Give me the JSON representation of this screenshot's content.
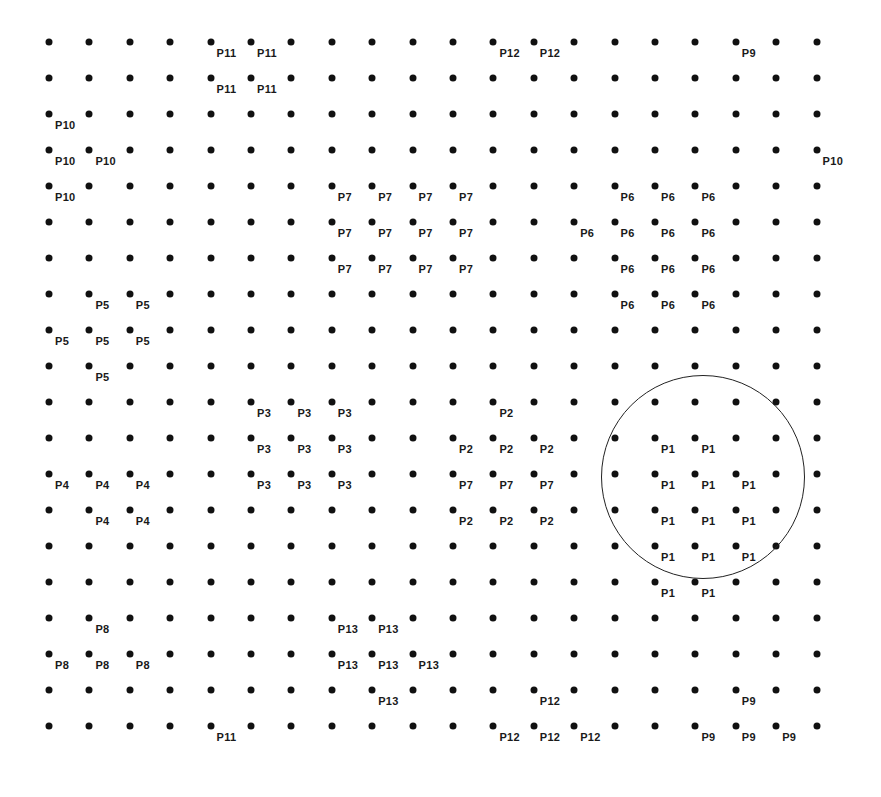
{
  "diagram": {
    "type": "labeled-grid",
    "grid": {
      "rows": 20,
      "cols": 20,
      "origin_x": 49,
      "origin_y": 42,
      "dx": 40.4,
      "dy": 36.0,
      "dot_color": "#111111"
    },
    "highlight_circle": {
      "center_x": 703,
      "center_y": 477,
      "radius": 102,
      "stroke": "#222222",
      "encloses_group": "P1"
    },
    "labels": [
      {
        "text": "P11",
        "row": 0,
        "col": 4
      },
      {
        "text": "P11",
        "row": 0,
        "col": 5
      },
      {
        "text": "P12",
        "row": 0,
        "col": 11
      },
      {
        "text": "P12",
        "row": 0,
        "col": 12
      },
      {
        "text": "P9",
        "row": 0,
        "col": 17
      },
      {
        "text": "P11",
        "row": 1,
        "col": 4
      },
      {
        "text": "P11",
        "row": 1,
        "col": 5
      },
      {
        "text": "P10",
        "row": 2,
        "col": 0
      },
      {
        "text": "P10",
        "row": 3,
        "col": 0
      },
      {
        "text": "P10",
        "row": 3,
        "col": 1
      },
      {
        "text": "P10",
        "row": 3,
        "col": 19
      },
      {
        "text": "P10",
        "row": 4,
        "col": 0
      },
      {
        "text": "P7",
        "row": 4,
        "col": 7
      },
      {
        "text": "P7",
        "row": 4,
        "col": 8
      },
      {
        "text": "P7",
        "row": 4,
        "col": 9
      },
      {
        "text": "P7",
        "row": 4,
        "col": 10
      },
      {
        "text": "P7",
        "row": 5,
        "col": 7
      },
      {
        "text": "P7",
        "row": 5,
        "col": 8
      },
      {
        "text": "P7",
        "row": 5,
        "col": 9
      },
      {
        "text": "P7",
        "row": 5,
        "col": 10
      },
      {
        "text": "P7",
        "row": 6,
        "col": 7
      },
      {
        "text": "P7",
        "row": 6,
        "col": 8
      },
      {
        "text": "P7",
        "row": 6,
        "col": 9
      },
      {
        "text": "P7",
        "row": 6,
        "col": 10
      },
      {
        "text": "P6",
        "row": 4,
        "col": 14
      },
      {
        "text": "P6",
        "row": 4,
        "col": 15
      },
      {
        "text": "P6",
        "row": 4,
        "col": 16
      },
      {
        "text": "P6",
        "row": 5,
        "col": 13
      },
      {
        "text": "P6",
        "row": 5,
        "col": 14
      },
      {
        "text": "P6",
        "row": 5,
        "col": 15
      },
      {
        "text": "P6",
        "row": 5,
        "col": 16
      },
      {
        "text": "P6",
        "row": 6,
        "col": 14
      },
      {
        "text": "P6",
        "row": 6,
        "col": 15
      },
      {
        "text": "P6",
        "row": 6,
        "col": 16
      },
      {
        "text": "P6",
        "row": 7,
        "col": 14
      },
      {
        "text": "P6",
        "row": 7,
        "col": 15
      },
      {
        "text": "P6",
        "row": 7,
        "col": 16
      },
      {
        "text": "P5",
        "row": 7,
        "col": 1
      },
      {
        "text": "P5",
        "row": 7,
        "col": 2
      },
      {
        "text": "P5",
        "row": 8,
        "col": 0
      },
      {
        "text": "P5",
        "row": 8,
        "col": 1
      },
      {
        "text": "P5",
        "row": 8,
        "col": 2
      },
      {
        "text": "P5",
        "row": 9,
        "col": 1
      },
      {
        "text": "P3",
        "row": 10,
        "col": 5
      },
      {
        "text": "P3",
        "row": 10,
        "col": 6
      },
      {
        "text": "P3",
        "row": 10,
        "col": 7
      },
      {
        "text": "P3",
        "row": 11,
        "col": 5
      },
      {
        "text": "P3",
        "row": 11,
        "col": 6
      },
      {
        "text": "P3",
        "row": 11,
        "col": 7
      },
      {
        "text": "P3",
        "row": 12,
        "col": 5
      },
      {
        "text": "P3",
        "row": 12,
        "col": 6
      },
      {
        "text": "P3",
        "row": 12,
        "col": 7
      },
      {
        "text": "P2",
        "row": 10,
        "col": 11
      },
      {
        "text": "P2",
        "row": 11,
        "col": 10
      },
      {
        "text": "P2",
        "row": 11,
        "col": 11
      },
      {
        "text": "P2",
        "row": 11,
        "col": 12
      },
      {
        "text": "P7",
        "row": 12,
        "col": 10
      },
      {
        "text": "P7",
        "row": 12,
        "col": 11
      },
      {
        "text": "P7",
        "row": 12,
        "col": 12
      },
      {
        "text": "P2",
        "row": 13,
        "col": 10
      },
      {
        "text": "P2",
        "row": 13,
        "col": 11
      },
      {
        "text": "P2",
        "row": 13,
        "col": 12
      },
      {
        "text": "P1",
        "row": 11,
        "col": 15
      },
      {
        "text": "P1",
        "row": 11,
        "col": 16
      },
      {
        "text": "P1",
        "row": 12,
        "col": 15
      },
      {
        "text": "P1",
        "row": 12,
        "col": 16
      },
      {
        "text": "P1",
        "row": 12,
        "col": 17
      },
      {
        "text": "P1",
        "row": 13,
        "col": 15
      },
      {
        "text": "P1",
        "row": 13,
        "col": 16
      },
      {
        "text": "P1",
        "row": 13,
        "col": 17
      },
      {
        "text": "P1",
        "row": 14,
        "col": 15
      },
      {
        "text": "P1",
        "row": 14,
        "col": 16
      },
      {
        "text": "P1",
        "row": 14,
        "col": 17
      },
      {
        "text": "P1",
        "row": 15,
        "col": 15
      },
      {
        "text": "P1",
        "row": 15,
        "col": 16
      },
      {
        "text": "P4",
        "row": 12,
        "col": 0
      },
      {
        "text": "P4",
        "row": 12,
        "col": 1
      },
      {
        "text": "P4",
        "row": 12,
        "col": 2
      },
      {
        "text": "P4",
        "row": 13,
        "col": 1
      },
      {
        "text": "P4",
        "row": 13,
        "col": 2
      },
      {
        "text": "P8",
        "row": 16,
        "col": 1
      },
      {
        "text": "P8",
        "row": 17,
        "col": 0
      },
      {
        "text": "P8",
        "row": 17,
        "col": 1
      },
      {
        "text": "P8",
        "row": 17,
        "col": 2
      },
      {
        "text": "P13",
        "row": 16,
        "col": 7
      },
      {
        "text": "P13",
        "row": 16,
        "col": 8
      },
      {
        "text": "P13",
        "row": 17,
        "col": 7
      },
      {
        "text": "P13",
        "row": 17,
        "col": 8
      },
      {
        "text": "P13",
        "row": 17,
        "col": 9
      },
      {
        "text": "P13",
        "row": 18,
        "col": 8
      },
      {
        "text": "P12",
        "row": 18,
        "col": 12
      },
      {
        "text": "P12",
        "row": 19,
        "col": 11
      },
      {
        "text": "P12",
        "row": 19,
        "col": 12
      },
      {
        "text": "P12",
        "row": 19,
        "col": 13
      },
      {
        "text": "P9",
        "row": 18,
        "col": 17
      },
      {
        "text": "P9",
        "row": 19,
        "col": 16
      },
      {
        "text": "P9",
        "row": 19,
        "col": 17
      },
      {
        "text": "P9",
        "row": 19,
        "col": 18
      },
      {
        "text": "P11",
        "row": 19,
        "col": 4
      }
    ],
    "label_offset": {
      "dx": 6,
      "dy": 6
    }
  }
}
